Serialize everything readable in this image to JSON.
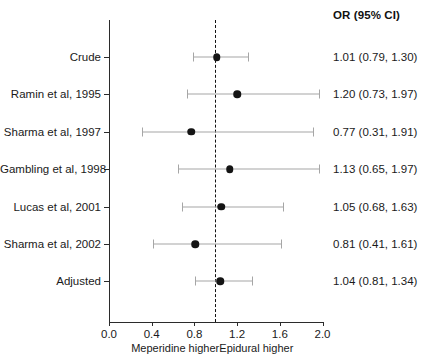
{
  "chart_data": {
    "type": "forest",
    "title": "",
    "column_header": "OR (95% CI)",
    "xlabel": "",
    "ylabel": "",
    "xlim": [
      0.0,
      2.0
    ],
    "xticks": [
      0.0,
      0.4,
      0.8,
      1.2,
      1.6,
      2.0
    ],
    "xtick_labels": [
      "0.0",
      "0.4",
      "0.8",
      "1.2",
      "1.6",
      "2.0"
    ],
    "reference_line": 1.0,
    "reference_line_style": "dashed",
    "grid": false,
    "legend": "none",
    "direction_labels": [
      {
        "text": "Meperidine higher",
        "at": 0.62
      },
      {
        "text": "Epidural higher",
        "at": 1.38
      }
    ],
    "categories": [
      "Crude",
      "Ramin et al, 1995",
      "Sharma et al, 1997",
      "Gambling et al, 1998",
      "Lucas et al, 2001",
      "Sharma et al, 2002",
      "Adjusted"
    ],
    "rows": [
      {
        "label": "Crude",
        "or": 1.01,
        "lower": 0.79,
        "upper": 1.3,
        "text": "1.01 (0.79, 1.30)"
      },
      {
        "label": "Ramin et al, 1995",
        "or": 1.2,
        "lower": 0.73,
        "upper": 1.97,
        "text": "1.20 (0.73, 1.97)"
      },
      {
        "label": "Sharma et al, 1997",
        "or": 0.77,
        "lower": 0.31,
        "upper": 1.91,
        "text": "0.77 (0.31, 1.91)"
      },
      {
        "label": "Gambling et al, 1998",
        "or": 1.13,
        "lower": 0.65,
        "upper": 1.97,
        "text": "1.13 (0.65, 1.97)"
      },
      {
        "label": "Lucas et al, 2001",
        "or": 1.05,
        "lower": 0.68,
        "upper": 1.63,
        "text": "1.05 (0.68, 1.63)"
      },
      {
        "label": "Sharma et al, 2002",
        "or": 0.81,
        "lower": 0.41,
        "upper": 1.61,
        "text": "0.81 (0.41, 1.61)"
      },
      {
        "label": "Adjusted",
        "or": 1.04,
        "lower": 0.81,
        "upper": 1.34,
        "text": "1.04 (0.81, 1.34)"
      }
    ],
    "colors": {
      "marker": "#141414",
      "ci": "#a6a6a6",
      "axis": "#2b2b2b",
      "reference": "#111111",
      "text": "#1a1a1a"
    }
  }
}
